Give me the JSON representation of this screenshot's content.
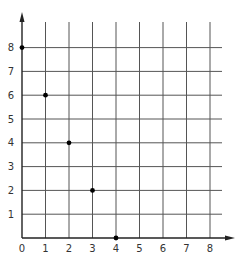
{
  "chart_data": {
    "type": "scatter",
    "title": "",
    "xlabel": "",
    "ylabel": "",
    "xlim": [
      0,
      8
    ],
    "ylim": [
      0,
      8
    ],
    "grid": true,
    "legend": null,
    "x_ticks": [
      "0",
      "1",
      "2",
      "3",
      "4",
      "5",
      "6",
      "7",
      "8"
    ],
    "y_ticks": [
      "1",
      "2",
      "3",
      "4",
      "5",
      "6",
      "7",
      "8"
    ],
    "series": [
      {
        "name": "points",
        "points": [
          {
            "x": 0,
            "y": 8
          },
          {
            "x": 1,
            "y": 6
          },
          {
            "x": 2,
            "y": 4
          },
          {
            "x": 3,
            "y": 2
          },
          {
            "x": 4,
            "y": 0
          }
        ]
      }
    ]
  },
  "colors": {
    "grid": "#555555",
    "axis": "#222222",
    "point": "#000000",
    "tick_text": "#333333"
  }
}
